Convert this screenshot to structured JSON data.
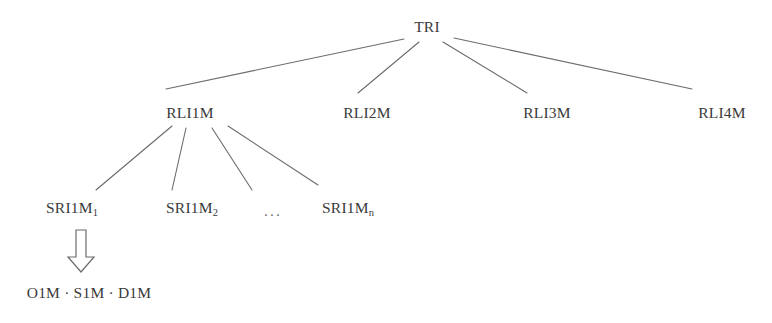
{
  "diagram": {
    "type": "tree-hierarchy",
    "background_color": "#ffffff",
    "line_color": "#6b6b6b",
    "text_color": "#3a3a3a",
    "root": {
      "id": "root",
      "label": "TRI",
      "x": 427,
      "y": 27
    },
    "level2": [
      {
        "id": "rli1m",
        "label": "RLI1M",
        "x": 190,
        "y": 113
      },
      {
        "id": "rli2m",
        "label": "RLI2M",
        "x": 367,
        "y": 113
      },
      {
        "id": "rli3m",
        "label": "RLI3M",
        "x": 547,
        "y": 113
      },
      {
        "id": "rli4m",
        "label": "RLI4M",
        "x": 722,
        "y": 113
      }
    ],
    "level3": [
      {
        "id": "sri1m1",
        "base": "SRI1M",
        "sub": "1",
        "x": 72,
        "y": 209
      },
      {
        "id": "sri1m2",
        "base": "SRI1M",
        "sub": "2",
        "x": 192,
        "y": 209
      },
      {
        "id": "sri1mn",
        "base": "SRI1M",
        "sub": "n",
        "x": 348,
        "y": 209
      }
    ],
    "ellipsis": {
      "id": "ellipsis",
      "label": "...",
      "x": 273,
      "y": 211
    },
    "leaf": {
      "id": "leaf-o1m-s1m-d1m",
      "label": "O1M · S1M · D1M",
      "x": 89,
      "y": 293
    },
    "arrow": {
      "id": "down-block-arrow",
      "name": "block-arrow-down",
      "from": "sri1m1",
      "to": "leaf-o1m-s1m-d1m"
    },
    "edges": [
      {
        "id": "e-root-rli1m",
        "from": "root",
        "to": "rli1m",
        "x1": 404,
        "y1": 39,
        "x2": 166,
        "y2": 89
      },
      {
        "id": "e-root-rli2m",
        "from": "root",
        "to": "rli2m",
        "x1": 419,
        "y1": 42,
        "x2": 358,
        "y2": 93
      },
      {
        "id": "e-root-rli3m",
        "from": "root",
        "to": "rli3m",
        "x1": 443,
        "y1": 42,
        "x2": 527,
        "y2": 93
      },
      {
        "id": "e-root-rli4m",
        "from": "root",
        "to": "rli4m",
        "x1": 454,
        "y1": 38,
        "x2": 692,
        "y2": 89
      },
      {
        "id": "e-rli1m-sri1m1",
        "from": "rli1m",
        "to": "sri1m1",
        "x1": 172,
        "y1": 126,
        "x2": 96,
        "y2": 190
      },
      {
        "id": "e-rli1m-sri1m2",
        "from": "rli1m",
        "to": "sri1m2",
        "x1": 186,
        "y1": 128,
        "x2": 172,
        "y2": 190
      },
      {
        "id": "e-rli1m-sri1mn-a",
        "from": "rli1m",
        "to": "sri1mn",
        "x1": 212,
        "y1": 128,
        "x2": 252,
        "y2": 190
      },
      {
        "id": "e-rli1m-sri1mn-b",
        "from": "rli1m",
        "to": "sri1mn",
        "x1": 228,
        "y1": 126,
        "x2": 318,
        "y2": 185
      }
    ]
  }
}
